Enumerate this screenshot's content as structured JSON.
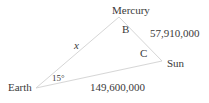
{
  "diagram": {
    "type": "triangle",
    "vertices": {
      "earth": {
        "label": "Earth"
      },
      "mercury": {
        "label": "Mercury"
      },
      "sun": {
        "label": "Sun"
      }
    },
    "angles": {
      "earth": {
        "label": "15°"
      },
      "mercury": {
        "label": "B"
      },
      "sun": {
        "label": "C"
      }
    },
    "sides": {
      "earth_mercury": {
        "label": "x"
      },
      "mercury_sun": {
        "label": "57,910,000"
      },
      "earth_sun": {
        "label": "149,600,000"
      }
    },
    "colors": {
      "line": "#d6d6d6",
      "text": "#3a3a3a"
    }
  }
}
